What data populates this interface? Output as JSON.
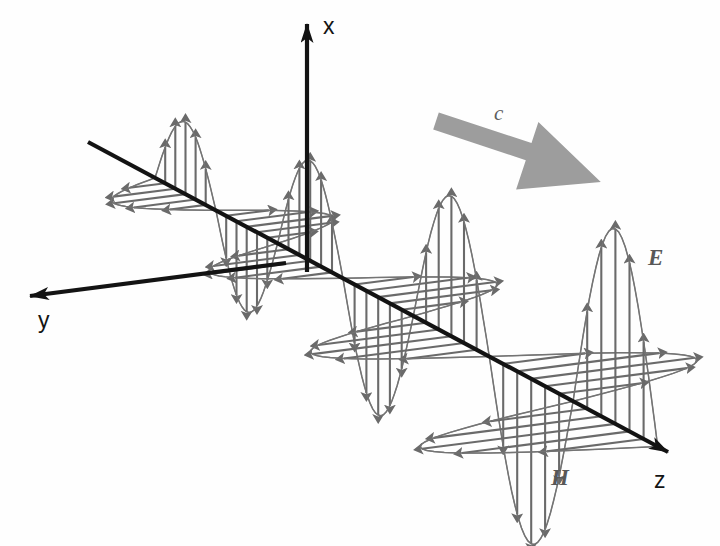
{
  "figure": {
    "background_color": "#fefefe"
  },
  "axes": {
    "x": {
      "label": "x",
      "direction": "up",
      "color": "#141414",
      "tip": {
        "x": 307,
        "y": 24
      },
      "tail": {
        "x": 307,
        "y": 272
      }
    },
    "y": {
      "label": "y",
      "direction": "left-down",
      "color": "#141414",
      "tip": {
        "x": 30,
        "y": 296
      },
      "tail": {
        "x": 286,
        "y": 263
      }
    },
    "z": {
      "label": "z",
      "direction": "right-down",
      "color": "#141414",
      "tip": {
        "x": 668,
        "y": 452
      },
      "tail": {
        "x": 88,
        "y": 142
      }
    }
  },
  "labels": {
    "E": {
      "text": "E",
      "meaning": "electric-field",
      "x": 648,
      "y": 265,
      "color": "#585858"
    },
    "H": {
      "text": "H",
      "meaning": "magnetic-field",
      "x": 551,
      "y": 485,
      "color": "#585858"
    },
    "c": {
      "text": "c",
      "meaning": "speed-of-light-propagation",
      "x": 494,
      "y": 120,
      "color": "#5d5d5d"
    }
  },
  "propagation_arrow": {
    "name": "propagation-direction-arrow",
    "color": "#9d9d9d",
    "from": {
      "x": 436,
      "y": 121
    },
    "to": {
      "x": 578,
      "y": 168
    }
  },
  "wave": {
    "color": "#6a6a6a",
    "envelope_color": "#747474",
    "lobe_count": 6,
    "amplitude_growth": "increasing left-to-right",
    "E_direction": "x (vertical)",
    "H_direction": "y (horizontal, into-left)",
    "phase_relation": "in-phase, mutually perpendicular, transverse to z",
    "lobes": [
      {
        "index": 0,
        "center_z": 110,
        "sign": 1,
        "amplitude": 72,
        "h_amplitude": 72
      },
      {
        "index": 1,
        "center_z": 180,
        "sign": -1,
        "amplitude": 85,
        "h_amplitude": 86
      },
      {
        "index": 2,
        "center_z": 250,
        "sign": 1,
        "amplitude": 100,
        "h_amplitude": 100
      },
      {
        "index": 3,
        "center_z": 328,
        "sign": -1,
        "amplitude": 118,
        "h_amplitude": 118
      },
      {
        "index": 4,
        "center_z": 410,
        "sign": 1,
        "amplitude": 140,
        "h_amplitude": 140
      },
      {
        "index": 5,
        "center_z": 500,
        "sign": -1,
        "amplitude": 165,
        "h_amplitude": 165
      },
      {
        "index": 6,
        "center_z": 600,
        "sign": 1,
        "amplitude": 195,
        "h_amplitude": 195
      }
    ]
  }
}
